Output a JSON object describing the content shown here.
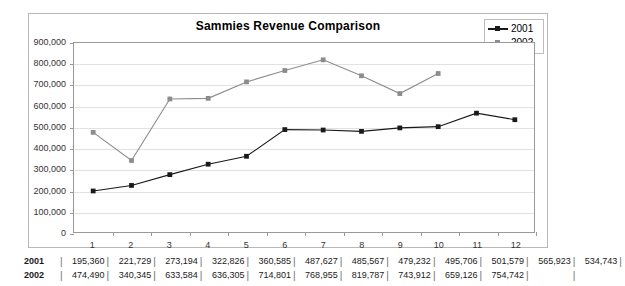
{
  "chart_data": {
    "type": "line",
    "title": "Sammies Revenue Comparison",
    "xlabel": "",
    "ylabel": "",
    "grid": true,
    "legend_position": "top-right",
    "categories": [
      "1",
      "2",
      "3",
      "4",
      "5",
      "6",
      "7",
      "8",
      "9",
      "10",
      "11",
      "12"
    ],
    "ylim": [
      0,
      900000
    ],
    "ytick_labels": [
      "900,000",
      "800,000",
      "700,000",
      "600,000",
      "500,000",
      "400,000",
      "300,000",
      "200,000",
      "100,000",
      "0"
    ],
    "ytick_values": [
      900000,
      800000,
      700000,
      600000,
      500000,
      400000,
      300000,
      200000,
      100000,
      0
    ],
    "series": [
      {
        "name": "2001",
        "color": "#1a1a1a",
        "marker": "square",
        "values": [
          195360,
          221729,
          273194,
          322826,
          360585,
          487627,
          485567,
          479232,
          495706,
          501579,
          565923,
          534743
        ]
      },
      {
        "name": "2002",
        "color": "#8c8c8c",
        "marker": "square",
        "values": [
          474490,
          340345,
          633584,
          636305,
          714801,
          768955,
          819787,
          743912,
          659126,
          754742,
          null,
          null
        ]
      }
    ]
  },
  "legend": {
    "items": [
      {
        "label": "2001",
        "color": "#1a1a1a"
      },
      {
        "label": "2002",
        "color": "#8c8c8c"
      }
    ]
  },
  "data_table": {
    "rows": [
      {
        "label": "2001",
        "cells": [
          "195,360",
          "221,729",
          "273,194",
          "322,826",
          "360,585",
          "487,627",
          "485,567",
          "479,232",
          "495,706",
          "501,579",
          "565,923",
          "534,743"
        ]
      },
      {
        "label": "2002",
        "cells": [
          "474,490",
          "340,345",
          "633,584",
          "636,305",
          "714,801",
          "768,955",
          "819,787",
          "743,912",
          "659,126",
          "754,742",
          "",
          ""
        ]
      }
    ]
  },
  "colors": {
    "series_2001": "#1a1a1a",
    "series_2002": "#8c8c8c",
    "gridline": "#e2e2e2",
    "axis": "#9a9a9a",
    "frame": "#b8b8b8",
    "background": "#ffffff"
  }
}
